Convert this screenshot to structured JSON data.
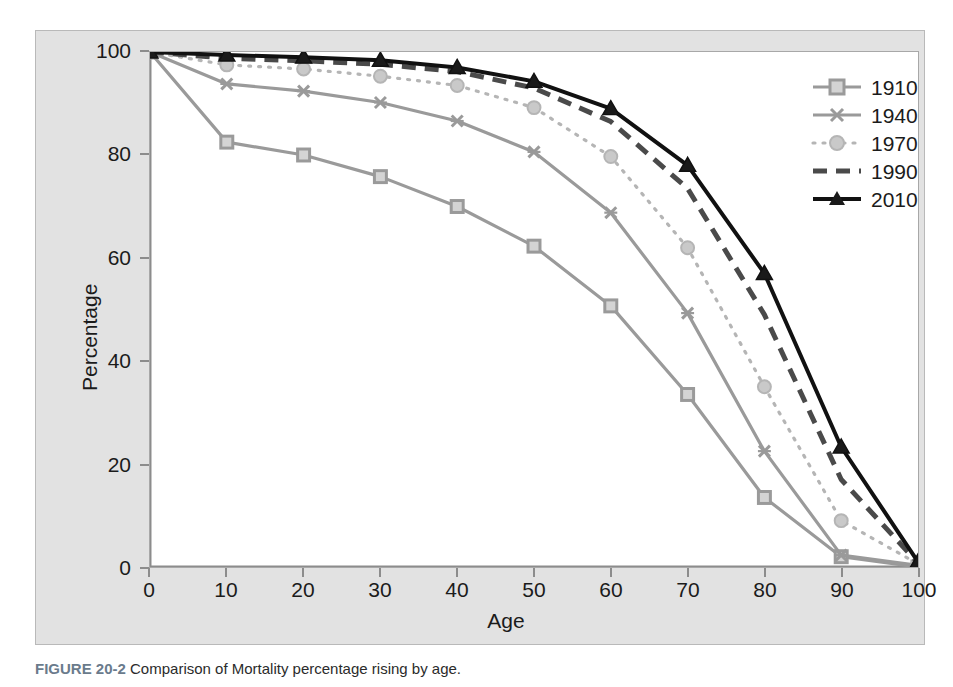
{
  "figure": {
    "caption_tag": "FIGURE 20-2",
    "caption_text": "Comparison of Mortality percentage rising by age."
  },
  "colors": {
    "panel_background": "#e2e2e2",
    "plot_background": "#ffffff",
    "axis": "#8c8c8c",
    "text": "#1b1b1b",
    "series_1910": "#9a9a9a",
    "series_1940": "#9a9a9a",
    "series_1970": "#b5b5b5",
    "series_1990": "#4a4a4a",
    "series_2010": "#111111"
  },
  "axes": {
    "x_title": "Age",
    "y_title": "Percentage",
    "x_ticks": [
      "0",
      "10",
      "20",
      "30",
      "40",
      "50",
      "60",
      "70",
      "80",
      "90",
      "100"
    ],
    "y_ticks": [
      "0",
      "20",
      "40",
      "60",
      "80",
      "100"
    ]
  },
  "legend": {
    "items": [
      {
        "label": "1910",
        "marker": "square",
        "style": "solid"
      },
      {
        "label": "1940",
        "marker": "cross",
        "style": "solid"
      },
      {
        "label": "1970",
        "marker": "circle",
        "style": "dotted"
      },
      {
        "label": "1990",
        "marker": "none",
        "style": "dashed"
      },
      {
        "label": "2010",
        "marker": "triangle",
        "style": "solid"
      }
    ]
  },
  "chart_data": {
    "type": "line",
    "title": "",
    "xlabel": "Age",
    "ylabel": "Percentage",
    "xlim": [
      0,
      100
    ],
    "ylim": [
      0,
      100
    ],
    "grid": false,
    "legend_position": "top-right",
    "x": [
      0,
      10,
      20,
      30,
      40,
      50,
      60,
      70,
      80,
      90,
      100
    ],
    "series": [
      {
        "name": "1910",
        "values": [
          100,
          82.5,
          80,
          75.8,
          70,
          62.3,
          50.7,
          33.5,
          13.5,
          2,
          0
        ],
        "marker": "square",
        "style": "solid",
        "color": "#9a9a9a"
      },
      {
        "name": "1940",
        "values": [
          100,
          93.8,
          92.4,
          90.2,
          86.6,
          80.6,
          68.8,
          49.3,
          22.5,
          2.3,
          0.3
        ],
        "marker": "cross",
        "style": "solid",
        "color": "#9a9a9a"
      },
      {
        "name": "1970",
        "values": [
          100,
          97.5,
          96.7,
          95.3,
          93.5,
          89.2,
          79.7,
          62,
          35,
          9,
          0.6
        ],
        "marker": "circle",
        "style": "dotted",
        "color": "#b5b5b5"
      },
      {
        "name": "1990",
        "values": [
          100,
          98.8,
          98.3,
          97.6,
          96.2,
          93,
          86.5,
          73.5,
          49,
          17,
          0.8
        ],
        "marker": "none",
        "style": "dashed",
        "color": "#4a4a4a"
      },
      {
        "name": "2010",
        "values": [
          100,
          99.4,
          99,
          98.4,
          97,
          94.3,
          89,
          78,
          57,
          23.3,
          1
        ],
        "marker": "triangle",
        "style": "solid",
        "color": "#111111"
      }
    ]
  }
}
